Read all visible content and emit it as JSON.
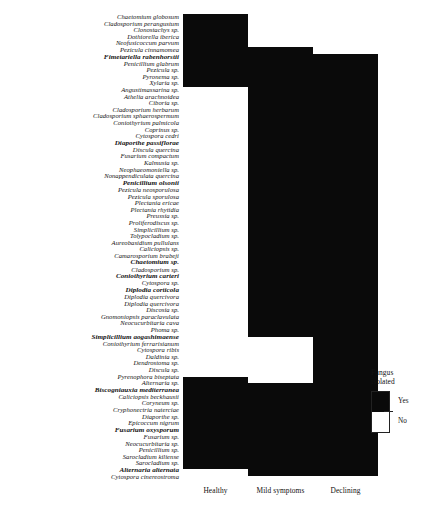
{
  "chart_data": {
    "type": "heatmap",
    "title": "",
    "xlabel": "",
    "ylabel": "",
    "grid": false,
    "legend_position": "right",
    "categories": [
      "Healthy",
      "Mild symptoms",
      "Declining"
    ],
    "value_labels": {
      "1": "Yes",
      "0": "No"
    },
    "colors": {
      "yes": "#0a0a0a",
      "no": "#ffffff"
    },
    "rows": [
      {
        "name": "Chaetomium globosum",
        "bold": false,
        "values": [
          1,
          0,
          0
        ]
      },
      {
        "name": "Cladosporium perangustum",
        "bold": false,
        "values": [
          1,
          0,
          0
        ]
      },
      {
        "name": "Clonostachys sp.",
        "bold": false,
        "values": [
          1,
          0,
          0
        ]
      },
      {
        "name": "Dothiorella iberica",
        "bold": false,
        "values": [
          1,
          0,
          0
        ]
      },
      {
        "name": "Neofusicoccum parvum",
        "bold": false,
        "values": [
          1,
          0,
          0
        ]
      },
      {
        "name": "Pezicula cinnamomea",
        "bold": false,
        "values": [
          1,
          1,
          0
        ]
      },
      {
        "name": "Fimetariella rabenhorstii",
        "bold": true,
        "values": [
          1,
          1,
          1
        ]
      },
      {
        "name": "Penicillium glabrum",
        "bold": false,
        "values": [
          1,
          1,
          1
        ]
      },
      {
        "name": "Pezicula sp.",
        "bold": false,
        "values": [
          1,
          1,
          1
        ]
      },
      {
        "name": "Pyronema sp.",
        "bold": false,
        "values": [
          1,
          1,
          1
        ]
      },
      {
        "name": "Xylaria sp.",
        "bold": false,
        "values": [
          1,
          1,
          1
        ]
      },
      {
        "name": "Angustimassarina sp.",
        "bold": false,
        "values": [
          0,
          1,
          1
        ]
      },
      {
        "name": "Athelia arachnoidea",
        "bold": false,
        "values": [
          0,
          1,
          1
        ]
      },
      {
        "name": "Ciboria sp.",
        "bold": false,
        "values": [
          0,
          1,
          1
        ]
      },
      {
        "name": "Cladosporium herbarum",
        "bold": false,
        "values": [
          0,
          1,
          1
        ]
      },
      {
        "name": "Cladosporium sphaerospermum",
        "bold": false,
        "values": [
          0,
          1,
          1
        ]
      },
      {
        "name": "Coniothyrium palmicola",
        "bold": false,
        "values": [
          0,
          1,
          1
        ]
      },
      {
        "name": "Coprinus sp.",
        "bold": false,
        "values": [
          0,
          1,
          1
        ]
      },
      {
        "name": "Cytospora cedri",
        "bold": false,
        "values": [
          0,
          1,
          1
        ]
      },
      {
        "name": "Diaporthe passiflorae",
        "bold": true,
        "values": [
          0,
          1,
          1
        ]
      },
      {
        "name": "Discula quercina",
        "bold": false,
        "values": [
          0,
          1,
          1
        ]
      },
      {
        "name": "Fusarium compactum",
        "bold": false,
        "values": [
          0,
          1,
          1
        ]
      },
      {
        "name": "Kalmusia sp.",
        "bold": false,
        "values": [
          0,
          1,
          1
        ]
      },
      {
        "name": "Neophaeomoniella sp.",
        "bold": false,
        "values": [
          0,
          1,
          1
        ]
      },
      {
        "name": "Nonappendiculata quercina",
        "bold": false,
        "values": [
          0,
          1,
          1
        ]
      },
      {
        "name": "Penicillium olsonii",
        "bold": true,
        "values": [
          0,
          1,
          1
        ]
      },
      {
        "name": "Pezicula neosporulosa",
        "bold": false,
        "values": [
          0,
          1,
          1
        ]
      },
      {
        "name": "Pezicula sporulosa",
        "bold": false,
        "values": [
          0,
          1,
          1
        ]
      },
      {
        "name": "Plectania ericae",
        "bold": false,
        "values": [
          0,
          1,
          1
        ]
      },
      {
        "name": "Plectania rhytidia",
        "bold": false,
        "values": [
          0,
          1,
          1
        ]
      },
      {
        "name": "Preussia sp.",
        "bold": false,
        "values": [
          0,
          1,
          1
        ]
      },
      {
        "name": "Proliferodiscus sp.",
        "bold": false,
        "values": [
          0,
          1,
          1
        ]
      },
      {
        "name": "Simplicillium sp.",
        "bold": false,
        "values": [
          0,
          1,
          1
        ]
      },
      {
        "name": "Tolypocladium sp.",
        "bold": false,
        "values": [
          0,
          1,
          1
        ]
      },
      {
        "name": "Aureobasidium pullulans",
        "bold": false,
        "values": [
          0,
          1,
          1
        ]
      },
      {
        "name": "Caliciopsis sp.",
        "bold": false,
        "values": [
          0,
          1,
          1
        ]
      },
      {
        "name": "Camarosporium brabeji",
        "bold": false,
        "values": [
          0,
          1,
          1
        ]
      },
      {
        "name": "Chaetomium sp.",
        "bold": true,
        "values": [
          0,
          1,
          1
        ]
      },
      {
        "name": "Cladosporium sp.",
        "bold": false,
        "values": [
          0,
          1,
          1
        ]
      },
      {
        "name": "Coniothyrium carteri",
        "bold": true,
        "values": [
          0,
          1,
          1
        ]
      },
      {
        "name": "Cytospora sp.",
        "bold": false,
        "values": [
          0,
          1,
          1
        ]
      },
      {
        "name": "Diplodia corticola",
        "bold": true,
        "values": [
          0,
          1,
          1
        ]
      },
      {
        "name": "Diplodia quercivora",
        "bold": false,
        "values": [
          0,
          1,
          1
        ]
      },
      {
        "name": "Diplodia quercivora ",
        "bold": false,
        "values": [
          0,
          1,
          1
        ]
      },
      {
        "name": "Discosia sp.",
        "bold": false,
        "values": [
          0,
          1,
          1
        ]
      },
      {
        "name": "Gnomoniopsis paraclavulata",
        "bold": false,
        "values": [
          0,
          1,
          1
        ]
      },
      {
        "name": "Neocucurbitaria cava",
        "bold": false,
        "values": [
          0,
          1,
          1
        ]
      },
      {
        "name": "Phoma sp.",
        "bold": false,
        "values": [
          0,
          1,
          1
        ]
      },
      {
        "name": "Simplicillium aogashimaense",
        "bold": true,
        "values": [
          0,
          1,
          1
        ]
      },
      {
        "name": "Coniothyrium ferrarisianum",
        "bold": false,
        "values": [
          0,
          0,
          1
        ]
      },
      {
        "name": "Cytospora ribis",
        "bold": false,
        "values": [
          0,
          0,
          1
        ]
      },
      {
        "name": "Daldinia sp.",
        "bold": false,
        "values": [
          0,
          0,
          1
        ]
      },
      {
        "name": "Dendrostoma sp.",
        "bold": false,
        "values": [
          0,
          0,
          1
        ]
      },
      {
        "name": "Discula sp.",
        "bold": false,
        "values": [
          0,
          0,
          1
        ]
      },
      {
        "name": "Pyrenophora biseptata",
        "bold": false,
        "values": [
          0,
          0,
          1
        ]
      },
      {
        "name": "Alternaria sp.",
        "bold": false,
        "values": [
          1,
          0,
          1
        ]
      },
      {
        "name": "Biscogniauxia mediterranea",
        "bold": true,
        "values": [
          1,
          1,
          1
        ]
      },
      {
        "name": "Caliciopsis beckhausii",
        "bold": false,
        "values": [
          1,
          1,
          1
        ]
      },
      {
        "name": "Coryneum sp.",
        "bold": false,
        "values": [
          1,
          1,
          1
        ]
      },
      {
        "name": "Cryphonectria naterciae",
        "bold": false,
        "values": [
          1,
          1,
          1
        ]
      },
      {
        "name": "Diaporthe sp.",
        "bold": false,
        "values": [
          1,
          1,
          1
        ]
      },
      {
        "name": "Epicoccum nigrum",
        "bold": false,
        "values": [
          1,
          1,
          1
        ]
      },
      {
        "name": "Fusarium oxysporum",
        "bold": true,
        "values": [
          1,
          1,
          1
        ]
      },
      {
        "name": "Fusarium sp.",
        "bold": false,
        "values": [
          1,
          1,
          1
        ]
      },
      {
        "name": "Neocucurbitaria sp.",
        "bold": false,
        "values": [
          1,
          1,
          1
        ]
      },
      {
        "name": "Penicillium sp.",
        "bold": false,
        "values": [
          1,
          1,
          1
        ]
      },
      {
        "name": "Sarocladium kiliense",
        "bold": false,
        "values": [
          1,
          1,
          1
        ]
      },
      {
        "name": "Sarocladium sp.",
        "bold": false,
        "values": [
          1,
          1,
          1
        ]
      },
      {
        "name": "Alternaria alternata",
        "bold": true,
        "values": [
          1,
          1,
          1
        ]
      },
      {
        "name": "Cytospora cinereostroma",
        "bold": false,
        "values": [
          0,
          1,
          1
        ]
      }
    ]
  },
  "legend": {
    "title": "Fungus\nisolated",
    "yes_label": "Yes",
    "no_label": "No"
  }
}
